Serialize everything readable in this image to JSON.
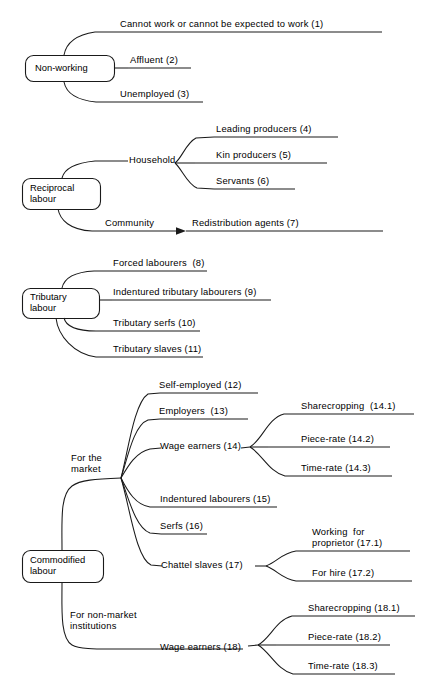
{
  "diagram": {
    "type": "mind-map",
    "background_color": "#ffffff",
    "line_color": "#1a1a1a",
    "text_color": "#000000",
    "roots": [
      {
        "id": "non-working",
        "label": "Non-working",
        "children": [
          {
            "id": "n1",
            "label": "Cannot work or cannot be expected to work (1)"
          },
          {
            "id": "n2",
            "label": "Affluent (2)"
          },
          {
            "id": "n3",
            "label": "Unemployed (3)"
          }
        ]
      },
      {
        "id": "reciprocal-labour",
        "label": "Reciprocal\nlabour",
        "label_line1": "Reciprocal",
        "label_line2": "labour",
        "children": [
          {
            "id": "household",
            "label": "Household",
            "children": [
              {
                "id": "n4",
                "label": "Leading producers (4)"
              },
              {
                "id": "n5",
                "label": "Kin producers (5)"
              },
              {
                "id": "n6",
                "label": "Servants (6)"
              }
            ]
          },
          {
            "id": "community",
            "label": "Community",
            "arrow": true,
            "children": [
              {
                "id": "n7",
                "label": "Redistribution agents (7)"
              }
            ]
          }
        ]
      },
      {
        "id": "tributary-labour",
        "label": "Tributary\nlabour",
        "label_line1": "Tributary",
        "label_line2": "labour",
        "children": [
          {
            "id": "n8",
            "label": "Forced labourers  (8)"
          },
          {
            "id": "n9",
            "label": "Indentured tributary labourers (9)"
          },
          {
            "id": "n10",
            "label": "Tributary serfs (10)"
          },
          {
            "id": "n11",
            "label": "Tributary slaves (11)"
          }
        ]
      },
      {
        "id": "commodified-labour",
        "label": "Commodified\nlabour",
        "label_line1": "Commodified",
        "label_line2": "labour",
        "children": [
          {
            "id": "for-the-market",
            "label": "For the\nmarket",
            "label_line1": "For the",
            "label_line2": "market",
            "children": [
              {
                "id": "n12",
                "label": "Self-employed (12)"
              },
              {
                "id": "n13",
                "label": "Employers  (13)"
              },
              {
                "id": "n14",
                "label": "Wage earners (14)",
                "children": [
                  {
                    "id": "n141",
                    "label": "Sharecropping  (14.1)"
                  },
                  {
                    "id": "n142",
                    "label": "Piece-rate (14.2)"
                  },
                  {
                    "id": "n143",
                    "label": "Time-rate (14.3)"
                  }
                ]
              },
              {
                "id": "n15",
                "label": "Indentured labourers (15)"
              },
              {
                "id": "n16",
                "label": "Serfs (16)"
              },
              {
                "id": "n17",
                "label": "Chattel slaves (17)",
                "children": [
                  {
                    "id": "n171",
                    "label": "Working  for\nproprietor (17.1)",
                    "label_line1": "Working  for",
                    "label_line2": "proprietor (17.1)"
                  },
                  {
                    "id": "n172",
                    "label": "For hire (17.2)"
                  }
                ]
              }
            ]
          },
          {
            "id": "for-non-market-institutions",
            "label": "For non-market\ninstitutions",
            "label_line1": "For non-market",
            "label_line2": "institutions",
            "children": [
              {
                "id": "n18",
                "label": "Wage earners (18)",
                "children": [
                  {
                    "id": "n181",
                    "label": "Sharecropping (18.1)"
                  },
                  {
                    "id": "n182",
                    "label": "Piece-rate (18.2)"
                  },
                  {
                    "id": "n183",
                    "label": "Time-rate (18.3)"
                  }
                ]
              }
            ]
          }
        ]
      }
    ]
  }
}
